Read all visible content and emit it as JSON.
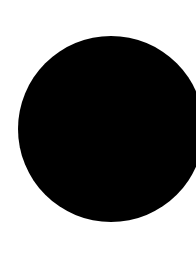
{
  "canvas": {
    "width": 196,
    "height": 264,
    "background_color": "#ffffff"
  },
  "shapes": [
    {
      "type": "circle",
      "fill_color": "#000000",
      "center_x": 111,
      "center_y": 129,
      "diameter": 186,
      "clipped_right": true
    }
  ]
}
